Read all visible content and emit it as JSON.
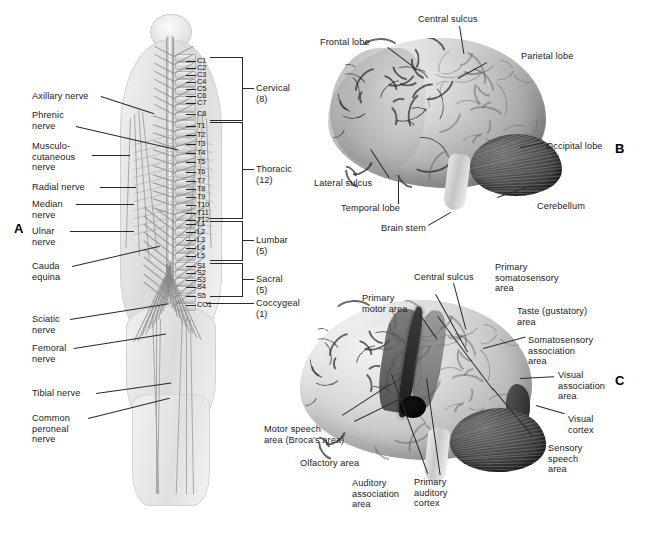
{
  "figure": {
    "panel_letters": {
      "a": "A",
      "b": "B",
      "c": "C"
    }
  },
  "panel_a": {
    "title": "Spinal nerves and peripheral nerve distribution",
    "nerve_labels": [
      {
        "id": "axillary",
        "text": "Axillary nerve"
      },
      {
        "id": "phrenic",
        "text": "Phrenic\nnerve"
      },
      {
        "id": "musculocutaneous",
        "text": "Musculo-\ncutaneous\nnerve"
      },
      {
        "id": "radial",
        "text": "Radial nerve"
      },
      {
        "id": "median",
        "text": "Median\nnerve"
      },
      {
        "id": "ulnar",
        "text": "Ulnar\nnerve"
      },
      {
        "id": "cauda-equina",
        "text": "Cauda\nequina"
      },
      {
        "id": "sciatic",
        "text": "Sciatic\nnerve"
      },
      {
        "id": "femoral",
        "text": "Femoral\nnerve"
      },
      {
        "id": "tibial",
        "text": "Tibial nerve"
      },
      {
        "id": "common-peroneal",
        "text": "Common\nperoneal\nnerve"
      }
    ],
    "vertebral_levels": [
      "C1",
      "C2",
      "C3",
      "C4",
      "C5",
      "C6",
      "C7",
      "C8",
      "T1",
      "T2",
      "T3",
      "T4",
      "T5",
      "T6",
      "T7",
      "T8",
      "T9",
      "T10",
      "T11",
      "T12",
      "L1",
      "L2",
      "L3",
      "L4",
      "L5",
      "S1",
      "S2",
      "S3",
      "S4",
      "S5",
      "CO1"
    ],
    "regions": [
      {
        "id": "cervical",
        "text": "Cervical (8)",
        "count": 8
      },
      {
        "id": "thoracic",
        "text": "Thoracic (12)",
        "count": 12
      },
      {
        "id": "lumbar",
        "text": "Lumbar (5)",
        "count": 5
      },
      {
        "id": "sacral",
        "text": "Sacral (5)",
        "count": 5
      },
      {
        "id": "coccygeal",
        "text": "Coccygeal (1)",
        "count": 1
      }
    ]
  },
  "panel_b": {
    "title": "Lateral view of the cerebrum — lobes and landmarks",
    "labels": [
      {
        "id": "frontal-lobe",
        "text": "Frontal lobe"
      },
      {
        "id": "central-sulcus",
        "text": "Central sulcus"
      },
      {
        "id": "parietal-lobe",
        "text": "Parietal lobe"
      },
      {
        "id": "occipital-lobe",
        "text": "Occipital lobe"
      },
      {
        "id": "cerebellum",
        "text": "Cerebellum"
      },
      {
        "id": "brain-stem",
        "text": "Brain stem"
      },
      {
        "id": "temporal-lobe",
        "text": "Temporal lobe"
      },
      {
        "id": "lateral-sulcus",
        "text": "Lateral sulcus"
      }
    ]
  },
  "panel_c": {
    "title": "Lateral view of the cerebrum — functional areas",
    "labels": [
      {
        "id": "primary-motor-area",
        "text": "Primary\nmotor area"
      },
      {
        "id": "central-sulcus",
        "text": "Central sulcus"
      },
      {
        "id": "primary-somatosensory-area",
        "text": "Primary\nsomatosensory\narea"
      },
      {
        "id": "taste-gustatory-area",
        "text": "Taste (gustatory)\narea"
      },
      {
        "id": "somatosensory-association-area",
        "text": "Somatosensory\nassociation\narea"
      },
      {
        "id": "visual-association-area",
        "text": "Visual\nassociation\narea"
      },
      {
        "id": "visual-cortex",
        "text": "Visual\ncortex"
      },
      {
        "id": "sensory-speech-area",
        "text": "Sensory\nspeech\narea"
      },
      {
        "id": "primary-auditory-cortex",
        "text": "Primary\nauditory\ncortex"
      },
      {
        "id": "auditory-association-area",
        "text": "Auditory\nassociation\narea"
      },
      {
        "id": "olfactory-area",
        "text": "Olfactory area"
      },
      {
        "id": "motor-speech-area",
        "text": "Motor speech\narea (Broca's area)"
      }
    ]
  },
  "colors": {
    "background": "#ffffff",
    "text": "#1b1b1b",
    "leader_line": "#2a2a2a",
    "brain_light": "#dcdcdc",
    "brain_dark": "#8d8d8d",
    "cerebellum": "#3f3f3f"
  }
}
